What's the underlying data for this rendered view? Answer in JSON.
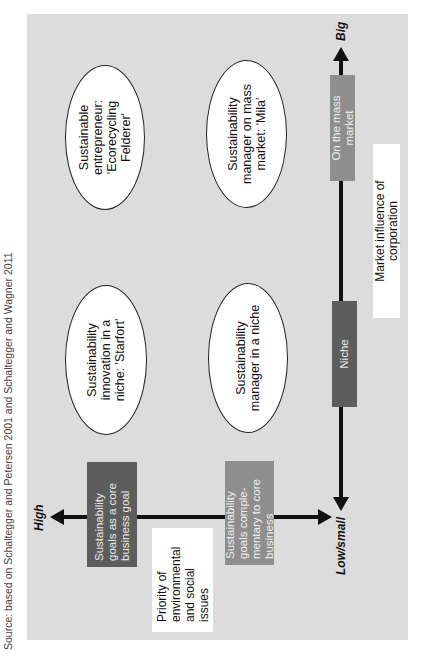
{
  "source_note": "Source: based on Schaltegger and Petersen 2001 and Schaltegger and Wagner 2011",
  "axes": {
    "market_influence": {
      "label": "Market influence of corporation",
      "low_label": "Low/small",
      "high_label": "Big",
      "segments": [
        {
          "id": "niche",
          "label": "Niche",
          "color": "#5d5d5d"
        },
        {
          "id": "mass-market",
          "label": "On the mass market",
          "color": "#8e8e8e"
        }
      ]
    },
    "priority": {
      "label": "Priority of environmental and social issues",
      "high_label": "High",
      "segments": [
        {
          "id": "core-goal",
          "label": "Sustainability goals as a core business goal",
          "color": "#5d5d5d"
        },
        {
          "id": "complementary",
          "label": "Sustainability goals comple-mentary to core business",
          "color": "#8e8e8e"
        }
      ]
    }
  },
  "quadrants": {
    "high_priority_big_market": "Sustainable entrepreneur: 'Ecorecycling Felderer'",
    "high_priority_niche": "Sustainability innovation in a niche: 'Starfort'",
    "low_priority_big_market": "Sustainability manager on mass market: 'Mila'",
    "low_priority_niche": "Sustainability manager in a niche"
  },
  "colors": {
    "panel": "#dcdcdc",
    "dark_box": "#5d5d5d",
    "mid_box": "#8e8e8e",
    "axis": "#111111"
  }
}
